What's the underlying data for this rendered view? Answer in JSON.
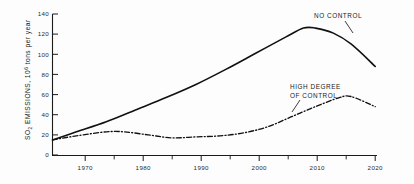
{
  "chart_data": {
    "type": "line",
    "title": "",
    "subtitle": "",
    "xlabel": "",
    "ylabel": "SO2 EMISSIONS, 10^6 tons per year",
    "ylabel_parts": {
      "lead": "SO",
      "subscript": "2",
      "mid": " EMISSIONS,  10",
      "superscript": "6",
      "tail": " tons per year"
    },
    "xlim": [
      1966,
      2020
    ],
    "ylim": [
      0,
      140
    ],
    "grid": false,
    "legend_position": "inline-annotations",
    "x_ticks_major": [
      "1970",
      "1980",
      "1990",
      "2000",
      "2010",
      "2020"
    ],
    "x_ticks_major_values": [
      1970,
      1980,
      1990,
      2000,
      2010,
      2020
    ],
    "x_ticks_minor_values": [
      1975,
      1985,
      1995,
      2005,
      2015
    ],
    "y_ticks": [
      "0",
      "20",
      "40",
      "60",
      "80",
      "100",
      "120",
      "140"
    ],
    "y_tick_values": [
      0,
      20,
      40,
      60,
      80,
      100,
      120,
      140
    ],
    "annotations": [
      {
        "id": "no-control",
        "text": "NO CONTROL",
        "lines": [
          "NO CONTROL"
        ]
      },
      {
        "id": "high-degree-of-control",
        "text": "HIGH DEGREE OF CONTROL",
        "lines": [
          "HIGH DEGREE",
          "OF CONTROL"
        ]
      }
    ],
    "series": [
      {
        "name": "NO CONTROL",
        "style": "solid",
        "color": "#111111",
        "x": [
          1966,
          1970,
          1975,
          1980,
          1985,
          1990,
          1995,
          2000,
          2005,
          2008,
          2010,
          2013,
          2016,
          2020
        ],
        "values": [
          15,
          23,
          33,
          45,
          57,
          70,
          85,
          101,
          117,
          126,
          126,
          121,
          110,
          88
        ]
      },
      {
        "name": "HIGH DEGREE OF CONTROL",
        "style": "dash-dot",
        "color": "#111111",
        "x": [
          1966,
          1970,
          1975,
          1978,
          1982,
          1986,
          1990,
          1994,
          1998,
          2002,
          2006,
          2010,
          2014,
          2016,
          2020
        ],
        "values": [
          15,
          19,
          23,
          23,
          20,
          17,
          18,
          19,
          22,
          28,
          38,
          48,
          57,
          58,
          48
        ]
      }
    ]
  }
}
